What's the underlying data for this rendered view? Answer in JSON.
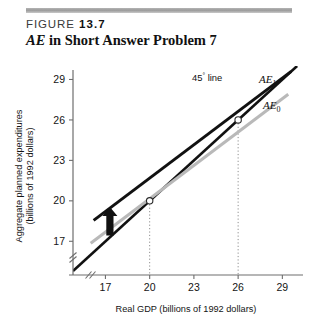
{
  "header": {
    "figure_word": "FIGURE",
    "figure_number": "13.7",
    "title_italic": "AE",
    "title_rest": " in Short Answer Problem 7"
  },
  "chart_data": {
    "type": "line",
    "title": "AE in Short Answer Problem 7",
    "xlabel": "Real GDP (billions of 1992 dollars)",
    "ylabel": "Aggregate planned expenditures (billions of 1992 dollars)",
    "ylabel_line1": "Aggregate planned expenditures",
    "ylabel_line2": "(billions of 1992 dollars)",
    "xticks": [
      "17",
      "20",
      "23",
      "26",
      "29"
    ],
    "xtick_values": [
      17,
      20,
      23,
      26,
      29
    ],
    "yticks": [
      "17",
      "20",
      "23",
      "26",
      "29"
    ],
    "ytick_values": [
      17,
      20,
      23,
      26,
      29
    ],
    "xlim": [
      14.8,
      30.4
    ],
    "ylim": [
      14.5,
      30.0
    ],
    "axis_break": true,
    "axis_break_symbol": "//",
    "grid": false,
    "legend": "inline-labels",
    "series": [
      {
        "name": "45° line",
        "label": "45° line",
        "color": "#111111",
        "style": "solid",
        "width_px": 2.6,
        "x": [
          14.8,
          30.0
        ],
        "y": [
          14.8,
          30.0
        ]
      },
      {
        "name": "AE0",
        "label": "AE",
        "label_sub": "0",
        "color": "#b9b9b9",
        "style": "solid",
        "width_px": 3.0,
        "x": [
          16.0,
          29.4
        ],
        "y": [
          16.85,
          27.9
        ],
        "slope": 0.825
      },
      {
        "name": "AE1",
        "label": "AE",
        "label_sub": "1",
        "color": "#111111",
        "style": "solid",
        "width_px": 3.0,
        "x": [
          16.2,
          29.6
        ],
        "y": [
          18.55,
          29.6
        ],
        "slope": 0.825
      }
    ],
    "equilibria": [
      {
        "x": 20,
        "y": 20,
        "marker": "open-circle",
        "on": "AE0"
      },
      {
        "x": 26,
        "y": 26,
        "marker": "open-circle",
        "on": "AE1"
      }
    ],
    "drop_lines": [
      {
        "x": 20,
        "from_y": 20,
        "to_y": 14.5,
        "style": "dotted"
      },
      {
        "x": 26,
        "from_y": 26,
        "to_y": 14.5,
        "style": "dotted"
      }
    ],
    "annotations": [
      {
        "name": "shift-arrow",
        "text": "",
        "direction": "up",
        "x": 17.3,
        "y": 18.4,
        "meaning": "upward shift of AE from AE0 to AE1",
        "color": "#111111"
      },
      {
        "name": "line45-label",
        "text": "45° line",
        "x": 25.0,
        "y": 28.8
      }
    ]
  }
}
